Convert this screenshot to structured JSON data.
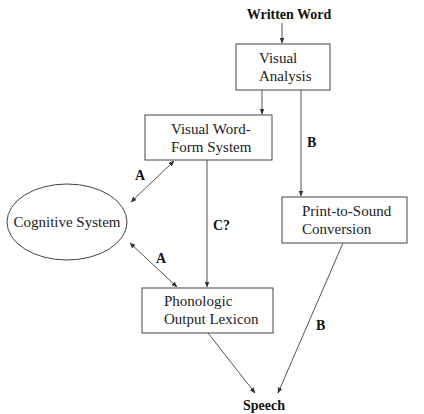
{
  "diagram": {
    "input_label": "Written Word",
    "output_label": "Speech",
    "nodes": {
      "visual_analysis": {
        "line1": "Visual",
        "line2": "Analysis"
      },
      "visual_word_form": {
        "line1": "Visual Word-",
        "line2": "Form System"
      },
      "print_to_sound": {
        "line1": "Print-to-Sound",
        "line2": "Conversion"
      },
      "cognitive_system": {
        "label": "Cognitive System"
      },
      "phonologic_output": {
        "line1": "Phonologic",
        "line2": "Output Lexicon"
      }
    },
    "edge_labels": {
      "a_upper": "A",
      "a_lower": "A",
      "b_upper": "B",
      "b_lower": "B",
      "c": "C?"
    }
  }
}
